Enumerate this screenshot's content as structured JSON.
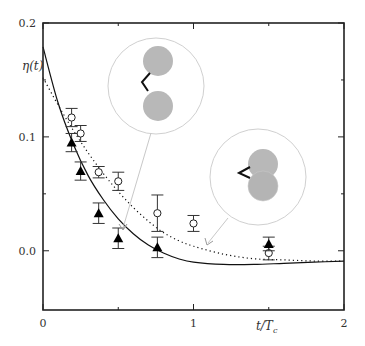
{
  "chart_data": {
    "type": "scatter",
    "title": "",
    "xlabel": "t/T_c",
    "ylabel": "η(t)",
    "xlim": [
      0,
      2
    ],
    "ylim": [
      -0.052,
      0.2
    ],
    "grid": false,
    "x_ticks": [
      {
        "value": 0,
        "label": "0"
      },
      {
        "value": 0.5,
        "label": ""
      },
      {
        "value": 1,
        "label": "1"
      },
      {
        "value": 1.5,
        "label": ""
      },
      {
        "value": 2,
        "label": "2"
      }
    ],
    "y_ticks": [
      {
        "value": 0.0,
        "label": "0.0"
      },
      {
        "value": 0.05,
        "label": ""
      },
      {
        "value": 0.1,
        "label": "0.1"
      },
      {
        "value": 0.15,
        "label": ""
      },
      {
        "value": 0.2,
        "label": "0.2"
      }
    ],
    "series": [
      {
        "name": "open circles",
        "marker": "open-circle",
        "points": [
          {
            "x": 0.19,
            "y": 0.117,
            "err": 0.008
          },
          {
            "x": 0.25,
            "y": 0.103,
            "err": 0.007
          },
          {
            "x": 0.37,
            "y": 0.069,
            "err": 0.005
          },
          {
            "x": 0.5,
            "y": 0.061,
            "err": 0.008
          },
          {
            "x": 0.76,
            "y": 0.033,
            "err": 0.016
          },
          {
            "x": 1.0,
            "y": 0.024,
            "err": 0.007
          },
          {
            "x": 1.5,
            "y": -0.002,
            "err": 0.006
          }
        ]
      },
      {
        "name": "filled triangles",
        "marker": "filled-triangle",
        "points": [
          {
            "x": 0.19,
            "y": 0.095,
            "err": 0.008
          },
          {
            "x": 0.25,
            "y": 0.07,
            "err": 0.008
          },
          {
            "x": 0.37,
            "y": 0.033,
            "err": 0.009
          },
          {
            "x": 0.5,
            "y": 0.011,
            "err": 0.009
          },
          {
            "x": 0.76,
            "y": 0.003,
            "err": 0.009
          },
          {
            "x": 1.5,
            "y": 0.006,
            "err": 0.006
          }
        ]
      },
      {
        "name": "solid curve",
        "style": "solid",
        "x": [
          0,
          0.1,
          0.2,
          0.3,
          0.4,
          0.5,
          0.6,
          0.7,
          0.8,
          0.9,
          1.0,
          1.2,
          1.4,
          1.6,
          1.8,
          2.0
        ],
        "y": [
          0.179,
          0.13,
          0.094,
          0.066,
          0.045,
          0.028,
          0.015,
          0.005,
          -0.002,
          -0.007,
          -0.01,
          -0.012,
          -0.012,
          -0.011,
          -0.01,
          -0.009
        ]
      },
      {
        "name": "dotted curve",
        "style": "dotted",
        "x": [
          0,
          0.1,
          0.2,
          0.3,
          0.4,
          0.5,
          0.6,
          0.7,
          0.8,
          0.9,
          1.0,
          1.2,
          1.4,
          1.6,
          1.8,
          2.0
        ],
        "y": [
          0.152,
          0.128,
          0.106,
          0.086,
          0.068,
          0.052,
          0.038,
          0.026,
          0.016,
          0.009,
          0.004,
          -0.003,
          -0.007,
          -0.008,
          -0.009,
          -0.009
        ]
      }
    ],
    "annotations": [
      {
        "type": "inset",
        "description": "two grey spheres connected by zig-zag linker, separated",
        "points_to": {
          "x": 0.53,
          "y": 0.02
        }
      },
      {
        "type": "inset",
        "description": "two grey spheres overlapping with bent linker",
        "points_to": {
          "x": 1.1,
          "y": 0.007
        }
      }
    ]
  },
  "labels": {
    "ylabel": "η(t)",
    "xlabel_main": "t/T",
    "xlabel_sub": "c"
  }
}
